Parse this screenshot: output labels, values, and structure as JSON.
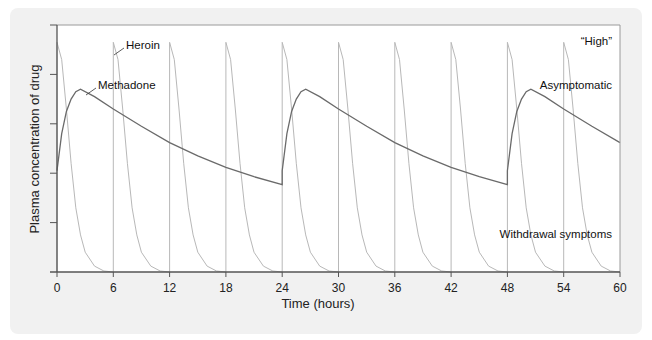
{
  "chart_data": {
    "type": "line",
    "title": "",
    "xlabel": "Time (hours)",
    "ylabel": "Plasma concentration of drug",
    "xlim": [
      0,
      60
    ],
    "ylim": [
      0,
      5
    ],
    "x_ticks": [
      "0",
      "6",
      "12",
      "18",
      "24",
      "30",
      "36",
      "42",
      "48",
      "54",
      "60"
    ],
    "y_ticks_count": 5,
    "y_tick_labels": [],
    "grid": false,
    "legend": "none (inline labels)",
    "annotations": {
      "high": "“High”",
      "asymptomatic": "Asymptomatic",
      "withdrawal": "Withdrawal symptoms"
    },
    "series": [
      {
        "name": "Heroin",
        "color": "#b8b8b8",
        "dosing_times": [
          0,
          6,
          12,
          18,
          24,
          30,
          36,
          42,
          48,
          54
        ],
        "peak": 4.65,
        "description": "Sharp spike at each 6-h dose then rapid decay to ~0 within ~5 h",
        "points": [
          [
            0,
            4.65
          ],
          [
            0.5,
            4.3
          ],
          [
            1,
            3.3
          ],
          [
            1.5,
            2.2
          ],
          [
            2,
            1.3
          ],
          [
            2.5,
            0.75
          ],
          [
            3,
            0.4
          ],
          [
            4,
            0.12
          ],
          [
            5,
            0.02
          ],
          [
            6,
            0
          ]
        ]
      },
      {
        "name": "Methadone",
        "color": "#6a6a6a",
        "dosing_times": [
          0,
          24,
          48
        ],
        "description": "Slow rise to peak ~2.5 h after dose, then slow decline; trough ~1.8 at 24 h",
        "points": [
          [
            0,
            2.05
          ],
          [
            0.5,
            2.8
          ],
          [
            1,
            3.25
          ],
          [
            1.5,
            3.5
          ],
          [
            2,
            3.65
          ],
          [
            2.5,
            3.7
          ],
          [
            4,
            3.55
          ],
          [
            6,
            3.3
          ],
          [
            9,
            2.95
          ],
          [
            12,
            2.62
          ],
          [
            15,
            2.35
          ],
          [
            18,
            2.12
          ],
          [
            21,
            1.93
          ],
          [
            24,
            1.77
          ]
        ]
      }
    ]
  },
  "labels": {
    "heroin": "Heroin",
    "methadone": "Methadone"
  }
}
